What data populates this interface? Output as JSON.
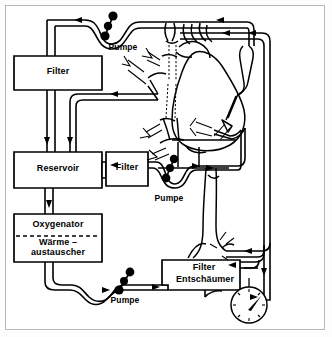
{
  "diagram": {
    "language": "de",
    "background_color": "#ffffff",
    "line_color": "#000000",
    "frame_color": "#b9b9b9"
  },
  "components": {
    "filter_top": {
      "label": "Filter",
      "x": 14,
      "y": 56,
      "w": 88,
      "h": 34
    },
    "reservoir": {
      "label": "Reservoir",
      "x": 14,
      "y": 152,
      "w": 88,
      "h": 36
    },
    "oxygenator": {
      "label": "Oxygenator",
      "x": 14,
      "y": 214,
      "w": 88,
      "h": 48
    },
    "heat_exchanger": {
      "label_line1": "Wärme –",
      "label_line2": "austauscher"
    },
    "filter_mid": {
      "label": "Filter",
      "x": 106,
      "y": 152,
      "w": 42,
      "h": 34
    },
    "filter_defoamer": {
      "label_line1": "Filter",
      "label_line2": "Entschäumer",
      "x": 168,
      "y": 260,
      "w": 72,
      "h": 30
    },
    "pump_top": {
      "label": "Pumpe"
    },
    "pump_mid": {
      "label": "Pumpe"
    },
    "pump_bottom": {
      "label": "Pumpe"
    },
    "pressure_gauge": {
      "name": "Manometer",
      "needle_angle_deg": -40
    }
  },
  "labels": [
    {
      "id": "pumpe-top",
      "text": "Pumpe",
      "x": 100,
      "y": 43,
      "size": "sm"
    },
    {
      "id": "filter-top",
      "text": "Filter",
      "x": 36,
      "y": 68,
      "size": "md"
    },
    {
      "id": "reservoir",
      "text": "Reservoir",
      "x": 24,
      "y": 165,
      "size": "md"
    },
    {
      "id": "filter-mid",
      "text": "Filter",
      "x": 111,
      "y": 164,
      "size": "md"
    },
    {
      "id": "pumpe-mid",
      "text": "Pumpe",
      "x": 148,
      "y": 194,
      "size": "sm"
    },
    {
      "id": "oxygenator",
      "text": "Oxygenator",
      "x": 20,
      "y": 222,
      "size": "md"
    },
    {
      "id": "waerme",
      "text": "Wärme –",
      "x": 32,
      "y": 239,
      "size": "md"
    },
    {
      "id": "austauscher",
      "text": "austauscher",
      "x": 20,
      "y": 249,
      "size": "md"
    },
    {
      "id": "filter-defoam",
      "text": "Filter",
      "x": 188,
      "y": 264,
      "size": "md"
    },
    {
      "id": "entschaeumer",
      "text": "Entschäumer",
      "x": 170,
      "y": 276,
      "size": "md"
    },
    {
      "id": "pumpe-bottom",
      "text": "Pumpe",
      "x": 104,
      "y": 296,
      "size": "sm"
    }
  ],
  "anatomy": {
    "name": "heart-with-cannulae",
    "parts": [
      "vena-cava-superior",
      "vena-cava-inferior",
      "aorta",
      "pulmonary-artery",
      "right-atrium",
      "left-ventricle"
    ],
    "cannulae_count": 4
  },
  "flow_arrows": {
    "count": 13,
    "description": "Richtungspfeile im Schlauchsystem"
  }
}
